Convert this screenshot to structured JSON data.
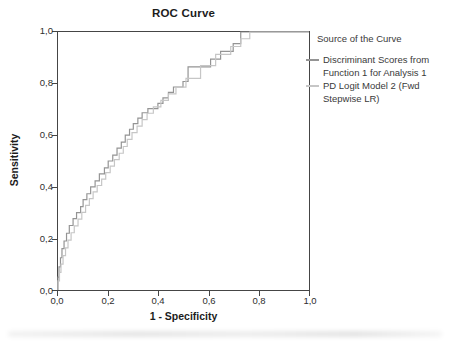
{
  "title": "ROC Curve",
  "axes": {
    "y_label": "Sensitivity",
    "x_label": "1 - Specificity",
    "y_ticks": [
      "1,0",
      "0,8",
      "0,6",
      "0,4",
      "0,2",
      "0,0"
    ],
    "x_ticks": [
      "0,0",
      "0,2",
      "0,4",
      "0,6",
      "0,8",
      "1,0"
    ]
  },
  "legend": {
    "title": "Source of the Curve",
    "entries": [
      {
        "label": "Discriminant Scores from Function 1 for Analysis 1",
        "color": "#949494"
      },
      {
        "label": "PD Logit Model 2 (Fwd Stepwise LR)",
        "color": "#c6c6c6"
      }
    ]
  },
  "chart_data": {
    "type": "line",
    "subtype": "roc-step-curves",
    "title": "ROC Curve",
    "xlabel": "1 - Specificity",
    "ylabel": "Sensitivity",
    "xlim": [
      0,
      1
    ],
    "ylim": [
      0,
      1
    ],
    "x_tick_values": [
      0.0,
      0.2,
      0.4,
      0.6,
      0.8,
      1.0
    ],
    "y_tick_values": [
      0.0,
      0.2,
      0.4,
      0.6,
      0.8,
      1.0
    ],
    "grid": false,
    "legend_title": "Source of the Curve",
    "legend_position": "right",
    "series": [
      {
        "name": "Discriminant Scores from Function 1 for Analysis 1",
        "color": "#949494",
        "points": [
          [
            0,
            0
          ],
          [
            0,
            0.05
          ],
          [
            0.004,
            0.05
          ],
          [
            0.004,
            0.09
          ],
          [
            0.01,
            0.09
          ],
          [
            0.01,
            0.125
          ],
          [
            0.016,
            0.125
          ],
          [
            0.016,
            0.16
          ],
          [
            0.024,
            0.16
          ],
          [
            0.024,
            0.19
          ],
          [
            0.034,
            0.19
          ],
          [
            0.034,
            0.22
          ],
          [
            0.045,
            0.22
          ],
          [
            0.045,
            0.25
          ],
          [
            0.06,
            0.25
          ],
          [
            0.06,
            0.277
          ],
          [
            0.074,
            0.277
          ],
          [
            0.074,
            0.3
          ],
          [
            0.09,
            0.3
          ],
          [
            0.09,
            0.323
          ],
          [
            0.1,
            0.323
          ],
          [
            0.1,
            0.35
          ],
          [
            0.115,
            0.35
          ],
          [
            0.115,
            0.373
          ],
          [
            0.13,
            0.373
          ],
          [
            0.13,
            0.4
          ],
          [
            0.148,
            0.4
          ],
          [
            0.148,
            0.423
          ],
          [
            0.165,
            0.423
          ],
          [
            0.165,
            0.45
          ],
          [
            0.185,
            0.45
          ],
          [
            0.185,
            0.473
          ],
          [
            0.2,
            0.473
          ],
          [
            0.2,
            0.5
          ],
          [
            0.218,
            0.5
          ],
          [
            0.218,
            0.523
          ],
          [
            0.235,
            0.523
          ],
          [
            0.235,
            0.55
          ],
          [
            0.252,
            0.55
          ],
          [
            0.252,
            0.573
          ],
          [
            0.268,
            0.573
          ],
          [
            0.268,
            0.6
          ],
          [
            0.285,
            0.6
          ],
          [
            0.285,
            0.623
          ],
          [
            0.3,
            0.623
          ],
          [
            0.3,
            0.645
          ],
          [
            0.318,
            0.645
          ],
          [
            0.318,
            0.666
          ],
          [
            0.335,
            0.666
          ],
          [
            0.335,
            0.687
          ],
          [
            0.358,
            0.687
          ],
          [
            0.358,
            0.703
          ],
          [
            0.398,
            0.703
          ],
          [
            0.398,
            0.723
          ],
          [
            0.418,
            0.723
          ],
          [
            0.418,
            0.745
          ],
          [
            0.44,
            0.745
          ],
          [
            0.44,
            0.766
          ],
          [
            0.46,
            0.766
          ],
          [
            0.46,
            0.787
          ],
          [
            0.498,
            0.787
          ],
          [
            0.498,
            0.808
          ],
          [
            0.518,
            0.808
          ],
          [
            0.518,
            0.865
          ],
          [
            0.608,
            0.865
          ],
          [
            0.608,
            0.895
          ],
          [
            0.648,
            0.895
          ],
          [
            0.648,
            0.925
          ],
          [
            0.698,
            0.925
          ],
          [
            0.698,
            0.955
          ],
          [
            0.728,
            0.955
          ],
          [
            0.728,
            1
          ],
          [
            1,
            1
          ]
        ]
      },
      {
        "name": "PD Logit Model 2 (Fwd Stepwise LR)",
        "color": "#c6c6c6",
        "points": [
          [
            0,
            0
          ],
          [
            0,
            0.035
          ],
          [
            0.006,
            0.035
          ],
          [
            0.006,
            0.068
          ],
          [
            0.012,
            0.068
          ],
          [
            0.012,
            0.1
          ],
          [
            0.02,
            0.1
          ],
          [
            0.02,
            0.133
          ],
          [
            0.03,
            0.133
          ],
          [
            0.03,
            0.163
          ],
          [
            0.04,
            0.163
          ],
          [
            0.04,
            0.193
          ],
          [
            0.052,
            0.193
          ],
          [
            0.052,
            0.222
          ],
          [
            0.065,
            0.222
          ],
          [
            0.065,
            0.249
          ],
          [
            0.08,
            0.249
          ],
          [
            0.08,
            0.275
          ],
          [
            0.095,
            0.275
          ],
          [
            0.095,
            0.301
          ],
          [
            0.11,
            0.301
          ],
          [
            0.11,
            0.328
          ],
          [
            0.125,
            0.328
          ],
          [
            0.125,
            0.354
          ],
          [
            0.14,
            0.354
          ],
          [
            0.14,
            0.38
          ],
          [
            0.156,
            0.38
          ],
          [
            0.156,
            0.405
          ],
          [
            0.174,
            0.405
          ],
          [
            0.174,
            0.43
          ],
          [
            0.19,
            0.43
          ],
          [
            0.19,
            0.455
          ],
          [
            0.208,
            0.455
          ],
          [
            0.208,
            0.48
          ],
          [
            0.225,
            0.48
          ],
          [
            0.225,
            0.505
          ],
          [
            0.244,
            0.505
          ],
          [
            0.244,
            0.53
          ],
          [
            0.26,
            0.53
          ],
          [
            0.26,
            0.556
          ],
          [
            0.276,
            0.556
          ],
          [
            0.276,
            0.584
          ],
          [
            0.295,
            0.584
          ],
          [
            0.295,
            0.61
          ],
          [
            0.315,
            0.61
          ],
          [
            0.315,
            0.635
          ],
          [
            0.335,
            0.635
          ],
          [
            0.335,
            0.66
          ],
          [
            0.355,
            0.66
          ],
          [
            0.355,
            0.685
          ],
          [
            0.38,
            0.685
          ],
          [
            0.38,
            0.71
          ],
          [
            0.41,
            0.71
          ],
          [
            0.41,
            0.735
          ],
          [
            0.44,
            0.735
          ],
          [
            0.44,
            0.76
          ],
          [
            0.47,
            0.76
          ],
          [
            0.47,
            0.786
          ],
          [
            0.51,
            0.786
          ],
          [
            0.51,
            0.82
          ],
          [
            0.568,
            0.82
          ],
          [
            0.568,
            0.87
          ],
          [
            0.628,
            0.87
          ],
          [
            0.628,
            0.913
          ],
          [
            0.688,
            0.913
          ],
          [
            0.688,
            0.944
          ],
          [
            0.728,
            0.944
          ],
          [
            0.728,
            0.974
          ],
          [
            0.764,
            0.974
          ],
          [
            0.764,
            1
          ],
          [
            1,
            1
          ]
        ]
      }
    ]
  }
}
